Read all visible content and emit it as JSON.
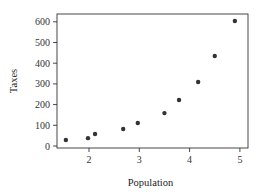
{
  "chart_data": {
    "type": "scatter",
    "title": "",
    "xlabel": "Population",
    "ylabel": "Taxes",
    "xlim": [
      1.35,
      5.15
    ],
    "ylim": [
      -10,
      625
    ],
    "xticks": [
      2,
      3,
      4,
      5
    ],
    "yticks": [
      0,
      100,
      200,
      300,
      400,
      500,
      600
    ],
    "grid": false,
    "legend": null,
    "marker_color": "#333333",
    "points": [
      {
        "x": 1.54,
        "y": 29
      },
      {
        "x": 1.98,
        "y": 38
      },
      {
        "x": 2.12,
        "y": 58
      },
      {
        "x": 2.68,
        "y": 82
      },
      {
        "x": 2.97,
        "y": 111
      },
      {
        "x": 3.5,
        "y": 159
      },
      {
        "x": 3.79,
        "y": 222
      },
      {
        "x": 4.17,
        "y": 309
      },
      {
        "x": 4.5,
        "y": 435
      },
      {
        "x": 4.9,
        "y": 604
      }
    ]
  }
}
